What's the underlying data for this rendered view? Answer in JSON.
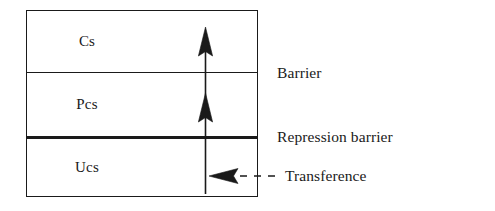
{
  "diagram": {
    "type": "layered-box-diagram",
    "background_color": "#ffffff",
    "line_color": "#1a1a1a",
    "box": {
      "layers": [
        {
          "id": "cs",
          "label": "Cs",
          "name": "conscious-layer"
        },
        {
          "id": "pcs",
          "label": "Pcs",
          "name": "preconscious-layer"
        },
        {
          "id": "ucs",
          "label": "Ucs",
          "name": "unconscious-layer"
        }
      ],
      "dividers": [
        {
          "id": "barrier",
          "style": "thin",
          "label": "Barrier"
        },
        {
          "id": "repression-barrier",
          "style": "thick",
          "label": "Repression barrier"
        }
      ]
    },
    "annotations": [
      {
        "id": "barrier",
        "label": "Barrier"
      },
      {
        "id": "repression-barrier",
        "label": "Repression barrier"
      },
      {
        "id": "transference",
        "label": "Transference",
        "connector": "dashed-with-arrowhead"
      }
    ],
    "arrows": [
      {
        "id": "upward-arrow-shaft",
        "direction": "up",
        "description": "vertical shaft from Ucs through Pcs into Cs"
      },
      {
        "id": "arrowhead-into-cs",
        "direction": "up",
        "description": "arrowhead in Cs layer"
      },
      {
        "id": "arrowhead-into-pcs",
        "direction": "up",
        "description": "arrowhead in Pcs layer"
      },
      {
        "id": "transference-arrowhead",
        "direction": "left",
        "description": "left-pointing arrowhead in Ucs layer"
      }
    ]
  }
}
